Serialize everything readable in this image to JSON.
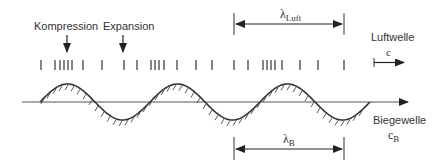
{
  "labels": {
    "compression": "Kompression",
    "expansion": "Expansion",
    "air_wave": "Luftwelle",
    "air_speed_symbol": "c",
    "bending_wave": "Biegewelle",
    "bending_speed_symbol": "c",
    "bending_speed_subscript": "B",
    "lambda_air_symbol": "λ",
    "lambda_air_subscript": "Luft",
    "lambda_bending_symbol": "λ",
    "lambda_bending_subscript": "B"
  },
  "colors": {
    "stroke": "#333333",
    "axis": "#555555",
    "background": "#ffffff"
  },
  "geometry": {
    "axis_y": 102,
    "wave_period_px": 110,
    "wave_amplitude_px": 18,
    "pressure_tick_x": [
      41,
      55,
      60,
      64,
      68,
      72,
      83,
      102,
      124,
      137,
      151,
      155,
      159,
      164,
      177,
      196,
      212,
      234,
      248,
      263,
      267,
      271,
      275,
      282,
      300,
      318,
      344
    ]
  }
}
